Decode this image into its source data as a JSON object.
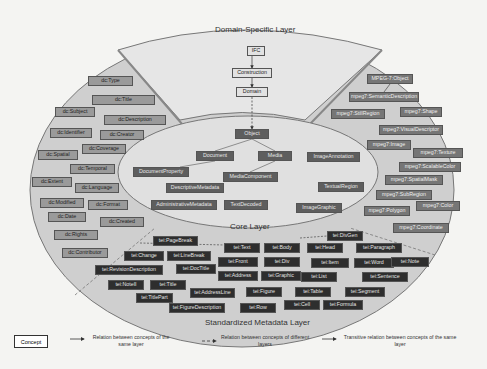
{
  "layers": {
    "domain": "Domain-Specific Layer",
    "core": "Core Layer",
    "standardized": "Standardized Metadata Layer"
  },
  "nodes": {
    "domain": [
      {
        "label": "IFC",
        "x": 247,
        "y": 46,
        "w": 18,
        "h": 10
      },
      {
        "label": "Construction",
        "x": 232,
        "y": 68,
        "w": 40,
        "h": 10
      },
      {
        "label": "Domain",
        "x": 236,
        "y": 87,
        "w": 32,
        "h": 10
      }
    ],
    "dc": [
      {
        "label": "dc:Type",
        "x": 88,
        "y": 76,
        "w": 45,
        "h": 10
      },
      {
        "label": "dc:Title",
        "x": 92,
        "y": 95,
        "w": 63,
        "h": 10
      },
      {
        "label": "dc:Subject",
        "x": 55,
        "y": 107,
        "w": 40,
        "h": 10
      },
      {
        "label": "dc:Description",
        "x": 104,
        "y": 115,
        "w": 62,
        "h": 10
      },
      {
        "label": "dc:Identifier",
        "x": 50,
        "y": 128,
        "w": 42,
        "h": 10
      },
      {
        "label": "dc:Creator",
        "x": 100,
        "y": 130,
        "w": 44,
        "h": 10
      },
      {
        "label": "dc:Coverage",
        "x": 82,
        "y": 144,
        "w": 44,
        "h": 10
      },
      {
        "label": "dc:Spatial",
        "x": 38,
        "y": 150,
        "w": 40,
        "h": 10
      },
      {
        "label": "dc:Temporal",
        "x": 70,
        "y": 164,
        "w": 45,
        "h": 10
      },
      {
        "label": "dc:Extent",
        "x": 32,
        "y": 177,
        "w": 40,
        "h": 10
      },
      {
        "label": "dc:Language",
        "x": 75,
        "y": 183,
        "w": 44,
        "h": 10
      },
      {
        "label": "dc:Modified",
        "x": 40,
        "y": 198,
        "w": 44,
        "h": 10
      },
      {
        "label": "dc:Format",
        "x": 88,
        "y": 200,
        "w": 40,
        "h": 10
      },
      {
        "label": "dc:Date",
        "x": 48,
        "y": 212,
        "w": 38,
        "h": 10
      },
      {
        "label": "dc:Created",
        "x": 100,
        "y": 217,
        "w": 44,
        "h": 10
      },
      {
        "label": "dc:Rights",
        "x": 54,
        "y": 230,
        "w": 44,
        "h": 10
      },
      {
        "label": "dc:Contributor",
        "x": 62,
        "y": 248,
        "w": 46,
        "h": 10
      }
    ],
    "mpeg": [
      {
        "label": "MPEG-7:Object",
        "x": 367,
        "y": 74,
        "w": 46,
        "h": 10
      },
      {
        "label": "mpeg7:SemanticDescription",
        "x": 349,
        "y": 92,
        "w": 70,
        "h": 10
      },
      {
        "label": "mpeg7:StillRegion",
        "x": 331,
        "y": 109,
        "w": 54,
        "h": 10
      },
      {
        "label": "mpeg7:Shape",
        "x": 400,
        "y": 107,
        "w": 42,
        "h": 10
      },
      {
        "label": "mpeg7:VisualDescriptor",
        "x": 379,
        "y": 125,
        "w": 64,
        "h": 10
      },
      {
        "label": "mpeg7:Image",
        "x": 367,
        "y": 140,
        "w": 44,
        "h": 10
      },
      {
        "label": "mpeg7:Texture",
        "x": 413,
        "y": 148,
        "w": 50,
        "h": 10
      },
      {
        "label": "mpeg7:ScalableColor",
        "x": 399,
        "y": 162,
        "w": 62,
        "h": 10
      },
      {
        "label": "mpeg7:SpatialMask",
        "x": 385,
        "y": 175,
        "w": 58,
        "h": 10
      },
      {
        "label": "mpeg7:SubRegion",
        "x": 376,
        "y": 190,
        "w": 56,
        "h": 10
      },
      {
        "label": "mpeg7:Color",
        "x": 416,
        "y": 201,
        "w": 44,
        "h": 10
      },
      {
        "label": "mpeg7:Polygon",
        "x": 364,
        "y": 206,
        "w": 46,
        "h": 10
      },
      {
        "label": "mpeg7:Coordinate",
        "x": 393,
        "y": 223,
        "w": 56,
        "h": 10
      }
    ],
    "core": [
      {
        "label": "Object",
        "x": 235,
        "y": 129,
        "w": 34,
        "h": 10
      },
      {
        "label": "Document",
        "x": 196,
        "y": 151,
        "w": 38,
        "h": 10
      },
      {
        "label": "Media",
        "x": 258,
        "y": 151,
        "w": 34,
        "h": 10
      },
      {
        "label": "ImageAnnotation",
        "x": 307,
        "y": 152,
        "w": 53,
        "h": 10
      },
      {
        "label": "DocumentProperty",
        "x": 133,
        "y": 167,
        "w": 56,
        "h": 10
      },
      {
        "label": "MediaComponent",
        "x": 223,
        "y": 172,
        "w": 55,
        "h": 10
      },
      {
        "label": "DescriptiveMetadata",
        "x": 166,
        "y": 183,
        "w": 58,
        "h": 10
      },
      {
        "label": "TextualRegion",
        "x": 318,
        "y": 182,
        "w": 46,
        "h": 10
      },
      {
        "label": "AdministrativeMetadata",
        "x": 151,
        "y": 200,
        "w": 66,
        "h": 10
      },
      {
        "label": "TextDecoded",
        "x": 224,
        "y": 200,
        "w": 44,
        "h": 10
      },
      {
        "label": "ImageGraphic",
        "x": 296,
        "y": 203,
        "w": 46,
        "h": 10
      }
    ],
    "tei": [
      {
        "label": "tei:PageBreak",
        "x": 153,
        "y": 236,
        "w": 45,
        "h": 10
      },
      {
        "label": "tei:DivGen",
        "x": 327,
        "y": 231,
        "w": 36,
        "h": 10
      },
      {
        "label": "tei:Text",
        "x": 224,
        "y": 243,
        "w": 36,
        "h": 10
      },
      {
        "label": "tei:Body",
        "x": 264,
        "y": 243,
        "w": 36,
        "h": 10
      },
      {
        "label": "tei:Head",
        "x": 307,
        "y": 243,
        "w": 36,
        "h": 10
      },
      {
        "label": "tei:Paragraph",
        "x": 356,
        "y": 243,
        "w": 46,
        "h": 10
      },
      {
        "label": "tei:Change",
        "x": 124,
        "y": 251,
        "w": 40,
        "h": 10
      },
      {
        "label": "tei:LineBreak",
        "x": 167,
        "y": 251,
        "w": 44,
        "h": 10
      },
      {
        "label": "tei:Front",
        "x": 218,
        "y": 257,
        "w": 40,
        "h": 10
      },
      {
        "label": "tei:Div",
        "x": 264,
        "y": 257,
        "w": 36,
        "h": 10
      },
      {
        "label": "tei:Item",
        "x": 311,
        "y": 258,
        "w": 38,
        "h": 10
      },
      {
        "label": "tei:Word",
        "x": 354,
        "y": 258,
        "w": 40,
        "h": 10
      },
      {
        "label": "tei:Note",
        "x": 391,
        "y": 257,
        "w": 38,
        "h": 10
      },
      {
        "label": "tei:RevisionDescription",
        "x": 95,
        "y": 265,
        "w": 68,
        "h": 10
      },
      {
        "label": "tei:DocTitle",
        "x": 176,
        "y": 264,
        "w": 40,
        "h": 10
      },
      {
        "label": "tei:Address",
        "x": 218,
        "y": 271,
        "w": 40,
        "h": 10
      },
      {
        "label": "tei:Graphic",
        "x": 261,
        "y": 271,
        "w": 40,
        "h": 10
      },
      {
        "label": "tei:List",
        "x": 301,
        "y": 272,
        "w": 36,
        "h": 10
      },
      {
        "label": "tei:Sentence",
        "x": 362,
        "y": 272,
        "w": 46,
        "h": 10
      },
      {
        "label": "tei:NoteII",
        "x": 108,
        "y": 280,
        "w": 36,
        "h": 10
      },
      {
        "label": "tei:Title",
        "x": 150,
        "y": 280,
        "w": 36,
        "h": 10
      },
      {
        "label": "tei:AddressLine",
        "x": 190,
        "y": 288,
        "w": 45,
        "h": 10
      },
      {
        "label": "tei:Figure",
        "x": 246,
        "y": 287,
        "w": 36,
        "h": 10
      },
      {
        "label": "tei:Table",
        "x": 295,
        "y": 287,
        "w": 36,
        "h": 10
      },
      {
        "label": "tei:Segment",
        "x": 345,
        "y": 287,
        "w": 40,
        "h": 10
      },
      {
        "label": "tei:TitlePart",
        "x": 136,
        "y": 293,
        "w": 37,
        "h": 10
      },
      {
        "label": "tei:FigureDescription",
        "x": 169,
        "y": 303,
        "w": 56,
        "h": 10
      },
      {
        "label": "tei:Row",
        "x": 240,
        "y": 303,
        "w": 36,
        "h": 10
      },
      {
        "label": "tei:Cell",
        "x": 284,
        "y": 300,
        "w": 36,
        "h": 10
      },
      {
        "label": "tei:Formula",
        "x": 323,
        "y": 300,
        "w": 40,
        "h": 10
      }
    ]
  },
  "legend": {
    "concept": "Concept",
    "same_layer": "Relation between concepts of the same layer",
    "different_layers": "Relation between concepts of different layers",
    "transitive": "Transitive relation between concepts of the same layer"
  },
  "colors": {
    "background": "#f4f4f2",
    "outer_ellipse": "#cfcfcf",
    "core_ellipse": "#e0e0e0",
    "domain_sector": "#e6e6e6",
    "dc_node": "#9a9a9a",
    "mpeg_node": "#767676",
    "core_node": "#5e5e5e",
    "tei_node": "#2e2e2e"
  }
}
